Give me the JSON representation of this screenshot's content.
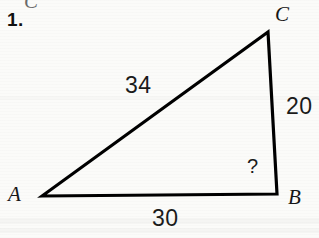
{
  "figure": {
    "problem_number": "1.",
    "ghost_glyph_above": "C",
    "background_color": "#fbfbf9",
    "stroke_color": "#000000",
    "text_color": "#161616"
  },
  "triangle": {
    "vertices": [
      {
        "name": "A",
        "label": "A",
        "x": 42,
        "y": 196
      },
      {
        "name": "B",
        "label": "B",
        "x": 277,
        "y": 194
      },
      {
        "name": "C",
        "label": "C",
        "x": 268,
        "y": 32
      }
    ],
    "sides": [
      {
        "name": "AC",
        "label": "34",
        "from": "A",
        "to": "C"
      },
      {
        "name": "BC",
        "label": "20",
        "from": "B",
        "to": "C"
      },
      {
        "name": "AB",
        "label": "30",
        "from": "A",
        "to": "B"
      }
    ],
    "angles": [
      {
        "at": "B",
        "label": "?",
        "known": false
      }
    ]
  },
  "chart_data": {
    "type": "diagram",
    "categories": [
      "AC",
      "BC",
      "AB"
    ],
    "values": [
      34,
      20,
      30
    ],
    "labels": [
      "34",
      "20",
      "30"
    ],
    "unknown": "?",
    "unknown_at_vertex": "B"
  }
}
